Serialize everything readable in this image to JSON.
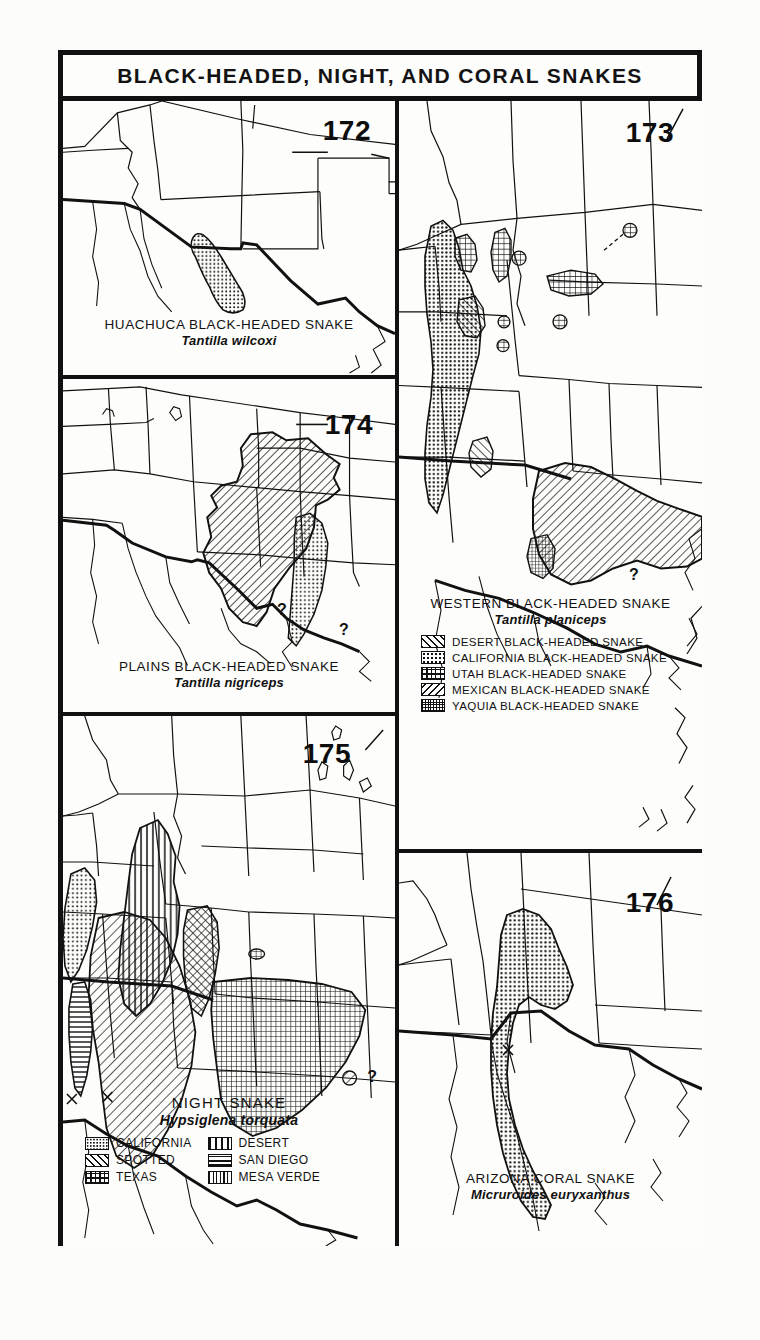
{
  "plate": {
    "title": "BLACK-HEADED, NIGHT, AND CORAL SNAKES"
  },
  "panels": [
    {
      "number": "172",
      "common_name": "HUACHUCA BLACK-HEADED SNAKE",
      "scientific_name": "Tantilla wilcoxi",
      "range_pattern": "stipple",
      "region": "southeastern Arizona / southwestern New Mexico border",
      "markers": []
    },
    {
      "number": "174",
      "common_name": "PLAINS BLACK-HEADED SNAKE",
      "scientific_name": "Tantilla nigriceps",
      "range_pattern": "diagonal-hatch-and-stipple",
      "region": "southern Great Plains: Nebraska to Texas and New Mexico",
      "markers": [
        "?",
        "?"
      ]
    },
    {
      "number": "173",
      "common_name": "WESTERN BLACK-HEADED SNAKE",
      "scientific_name": "Tantilla planiceps",
      "range_pattern": "multiple",
      "region": "California, Nevada, Utah, Arizona, Mexico",
      "markers": [
        "?"
      ],
      "legend": [
        {
          "pattern": "diagonal-forward",
          "label": "DESERT BLACK-HEADED SNAKE"
        },
        {
          "pattern": "stipple",
          "label": "CALIFORNIA BLACK-HEADED SNAKE"
        },
        {
          "pattern": "grid",
          "label": "UTAH BLACK-HEADED SNAKE"
        },
        {
          "pattern": "diagonal-backward",
          "label": "MEXICAN BLACK-HEADED SNAKE"
        },
        {
          "pattern": "grid-fine",
          "label": "YAQUIA BLACK-HEADED SNAKE"
        }
      ]
    },
    {
      "number": "175",
      "common_name": "NIGHT SNAKE",
      "scientific_name": "Hypsiglena torquata",
      "range_pattern": "multiple",
      "region": "western United States and northern Mexico",
      "markers": [
        "?",
        "x",
        "x"
      ],
      "legend": [
        {
          "pattern": "stipple",
          "label": "CALIFORNIA"
        },
        {
          "pattern": "vertical",
          "label": "DESERT"
        },
        {
          "pattern": "diagonal-forward",
          "label": "SPOTTED"
        },
        {
          "pattern": "horizontal",
          "label": "SAN DIEGO"
        },
        {
          "pattern": "grid",
          "label": "TEXAS"
        },
        {
          "pattern": "vertical-fine",
          "label": "MESA VERDE"
        }
      ]
    },
    {
      "number": "176",
      "common_name": "ARIZONA CORAL SNAKE",
      "scientific_name": "Micruroides euryxanthus",
      "range_pattern": "stipple",
      "region": "Arizona, southwestern New Mexico, and Sonora, Mexico",
      "markers": [
        "x"
      ]
    }
  ],
  "colors": {
    "ink": "#111111",
    "paper": "#fdfdfb"
  }
}
